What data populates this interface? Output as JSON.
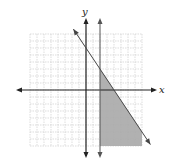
{
  "graph": {
    "x_label": "x",
    "y_label": "y",
    "grid_range": {
      "xmin": -8,
      "xmax": 8,
      "ymin": -8,
      "ymax": 8
    },
    "boundary_lines": [
      {
        "type": "line",
        "equation": "y = -1.5x + 6",
        "style": "solid"
      },
      {
        "type": "vertical",
        "equation": "x = 2",
        "style": "solid"
      }
    ],
    "shaded_region": "x >= 2 and y <= -1.5x + 6",
    "colors": {
      "shade": "#a9a9a9",
      "grid": "#c8c8c8",
      "axis": "#222222"
    }
  }
}
